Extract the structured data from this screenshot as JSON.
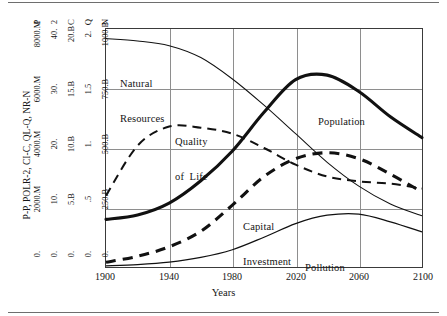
{
  "figure": {
    "yaxis_title": "P-P, POLR-2, CI-C, QL-Q, NR-N",
    "xaxis_title": "Years"
  },
  "chart_data": {
    "type": "line",
    "title": "",
    "subtitle": "",
    "xlabel": "Years",
    "ylabel": "P-P, POLR-2, CI-C, QL-Q, NR-N",
    "xlim": [
      1900,
      2100
    ],
    "xticks": [
      "1900",
      "1940",
      "1980",
      "2020",
      "2060",
      "2100"
    ],
    "xtick_values": [
      1900,
      1940,
      1980,
      2020,
      2060,
      2100
    ],
    "grid": true,
    "legend_position": "inline-annotations",
    "scales": [
      {
        "key": "P",
        "head": "P",
        "series": "Population",
        "ticks": [
          "0.",
          "2000.M",
          "4000.M",
          "6000.M",
          "8000.M"
        ],
        "values": [
          0,
          2000,
          4000,
          6000,
          8000
        ],
        "unit": "M"
      },
      {
        "key": "2",
        "head": "2",
        "series": "Pollution",
        "ticks": [
          "0.",
          "10.",
          "20.",
          "30.",
          "40."
        ],
        "values": [
          0,
          10,
          20,
          30,
          40
        ],
        "unit": ""
      },
      {
        "key": "C",
        "head": "C",
        "series": "Capital Investment",
        "ticks": [
          "0.",
          "5.B",
          "10.B",
          "15.B",
          "20.B"
        ],
        "values": [
          0,
          5,
          10,
          15,
          20
        ],
        "unit": "B"
      },
      {
        "key": "Q",
        "head": "Q",
        "series": "Quality of Life",
        "ticks": [
          "0.",
          ".5",
          "1.",
          "1.5",
          "2."
        ],
        "values": [
          0,
          0.5,
          1,
          1.5,
          2
        ],
        "unit": ""
      },
      {
        "key": "N",
        "head": "N",
        "series": "Natural Resources",
        "ticks": [
          "0.",
          "250.B",
          "500.B",
          "750.B",
          "1000.B"
        ],
        "values": [
          0,
          250,
          500,
          750,
          1000
        ],
        "unit": "B"
      }
    ],
    "series": [
      {
        "name": "Natural Resources",
        "scale": "N",
        "style": "thin-solid",
        "x": [
          1900,
          1920,
          1940,
          1960,
          1980,
          2000,
          2020,
          2040,
          2060,
          2080,
          2100
        ],
        "values": [
          960,
          950,
          930,
          880,
          790,
          680,
          560,
          440,
          340,
          265,
          215
        ]
      },
      {
        "name": "Quality of Life",
        "scale": "Q",
        "style": "thin-dashed",
        "x": [
          1900,
          1920,
          1940,
          1960,
          1980,
          2000,
          2020,
          2040,
          2060,
          2080,
          2100
        ],
        "values": [
          0.6,
          1.02,
          1.18,
          1.17,
          1.12,
          1.0,
          0.86,
          0.76,
          0.72,
          0.7,
          0.66
        ]
      },
      {
        "name": "Population",
        "scale": "P",
        "style": "thick-solid",
        "x": [
          1900,
          1920,
          1940,
          1960,
          1980,
          2000,
          2020,
          2040,
          2060,
          2080,
          2100
        ],
        "values": [
          1600,
          1750,
          2150,
          2900,
          3900,
          5200,
          6300,
          6450,
          5900,
          5050,
          4350
        ]
      },
      {
        "name": "Capital Investment",
        "scale": "C",
        "style": "thick-dashed",
        "x": [
          1900,
          1920,
          1940,
          1960,
          1980,
          2000,
          2020,
          2040,
          2060,
          2080,
          2100
        ],
        "values": [
          0.4,
          0.9,
          1.7,
          3.0,
          5.2,
          7.6,
          9.1,
          9.6,
          9.1,
          7.8,
          6.3
        ]
      },
      {
        "name": "Pollution",
        "scale": "2",
        "style": "thin-solid",
        "x": [
          1900,
          1920,
          1940,
          1960,
          1980,
          2000,
          2020,
          2040,
          2060,
          2080,
          2100
        ],
        "values": [
          0.2,
          0.4,
          0.8,
          1.6,
          2.9,
          5.0,
          7.3,
          8.7,
          8.9,
          7.6,
          5.9
        ]
      }
    ],
    "annotations": [
      {
        "text": "Natural\nResources",
        "line1": "Natural",
        "line2": "Resources",
        "series": "Natural Resources"
      },
      {
        "text": "Quality\nof Life",
        "line1": "Quality",
        "line2": "of  Life",
        "series": "Quality of Life"
      },
      {
        "text": "Population",
        "line1": "Population",
        "line2": "",
        "series": "Population"
      },
      {
        "text": "Capital\nInvestment",
        "line1": "Capital",
        "line2": "Investment",
        "series": "Capital Investment"
      },
      {
        "text": "Pollution",
        "line1": "Pollution",
        "line2": "",
        "series": "Pollution"
      }
    ],
    "colors": {
      "curve": "#111111",
      "grid": "#8e8e8e",
      "frame": "#3a3a3a",
      "text": "#151515",
      "background": "#ffffff"
    }
  }
}
